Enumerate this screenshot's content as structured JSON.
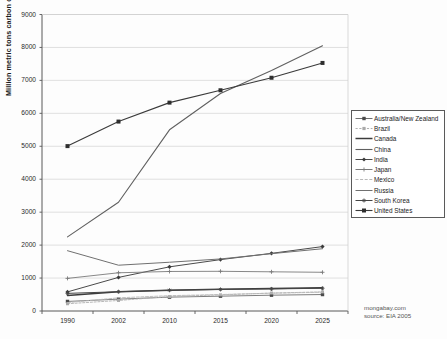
{
  "chart_data": {
    "type": "line",
    "title": "",
    "xlabel": "",
    "ylabel": "Million metric tons carbon dioxide",
    "categories": [
      "1990",
      "2002",
      "2010",
      "2015",
      "2020",
      "2025"
    ],
    "x": [
      1990,
      2002,
      2010,
      2015,
      2020,
      2025
    ],
    "ylim": [
      0,
      9000
    ],
    "ytick_labels": [
      "0",
      "1000",
      "2000",
      "3000",
      "4000",
      "5000",
      "6000",
      "7000",
      "8000",
      "9000"
    ],
    "ytick_values": [
      0,
      1000,
      2000,
      3000,
      4000,
      5000,
      6000,
      7000,
      8000,
      9000
    ],
    "grid": true,
    "legend_position": "right",
    "series": [
      {
        "name": "Australia/New Zealand",
        "marker": "square-small",
        "values": [
          290,
          360,
          420,
          450,
          480,
          500
        ]
      },
      {
        "name": "Brazil",
        "marker": "dotted-dash",
        "values": [
          220,
          320,
          440,
          490,
          545,
          580
        ]
      },
      {
        "name": "Canada",
        "marker": "line-thick",
        "values": [
          470,
          585,
          630,
          660,
          680,
          705
        ]
      },
      {
        "name": "China",
        "marker": "line-medium",
        "values": [
          2250,
          3300,
          5500,
          6600,
          7300,
          8050
        ]
      },
      {
        "name": "India",
        "marker": "diamond",
        "values": [
          580,
          1020,
          1340,
          1560,
          1750,
          1955
        ]
      },
      {
        "name": "Japan",
        "marker": "plus",
        "values": [
          990,
          1160,
          1200,
          1205,
          1190,
          1175
        ]
      },
      {
        "name": "Mexico",
        "marker": "dash-grey",
        "values": [
          255,
          400,
          465,
          500,
          540,
          570
        ]
      },
      {
        "name": "Russia",
        "marker": "plain-line",
        "values": [
          1830,
          1390,
          1480,
          1580,
          1740,
          1890
        ]
      },
      {
        "name": "South Korea",
        "marker": "star",
        "values": [
          535,
          585,
          630,
          655,
          670,
          690
        ]
      },
      {
        "name": "United States",
        "marker": "square-filled",
        "values": [
          5005,
          5750,
          6325,
          6700,
          7080,
          7530
        ]
      }
    ],
    "colors": {
      "axis": "#585858",
      "grid": "#d8d8d8",
      "plot_background": "#ffffff",
      "series_dark": "#3b3b3b",
      "series_mid": "#6b6b6b",
      "series_light": "#a9a9a9"
    }
  },
  "credit": {
    "site": "mongabay.com",
    "source": "source: EIA 2005"
  }
}
